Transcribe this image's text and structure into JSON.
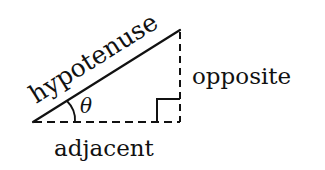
{
  "diagram": {
    "type": "right-triangle",
    "labels": {
      "hypotenuse": "hypotenuse",
      "opposite": "opposite",
      "adjacent": "adjacent",
      "angle": "θ"
    },
    "colors": {
      "stroke": "#111111",
      "background": "#ffffff"
    }
  }
}
